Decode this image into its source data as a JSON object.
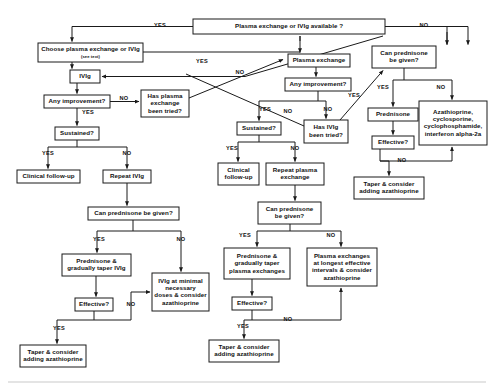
{
  "figure": {
    "type": "flowchart"
  },
  "colors": {
    "box_fill": "#ffffff",
    "box_stroke": "#1a1a1a",
    "text": "#111111",
    "edge": "#1a1a1a"
  },
  "nodes": {
    "n1": {
      "id": "n1",
      "label": "Plasma exchange or IVIg available ?",
      "x": 193,
      "y": 19,
      "w": 192,
      "h": 15
    },
    "n2": {
      "id": "n2",
      "label": "Choose plasma exchange or IVIg",
      "sublabel": "(see text)",
      "x": 38,
      "y": 43,
      "w": 105,
      "h": 19
    },
    "n3": {
      "id": "n3",
      "label": "IVIg",
      "x": 70,
      "y": 70,
      "w": 30,
      "h": 13
    },
    "n4": {
      "id": "n4",
      "label": "Any improvement?",
      "x": 44,
      "y": 95,
      "w": 66,
      "h": 13
    },
    "n5": {
      "id": "n5",
      "label": "Has plasma|exchange|been tried?",
      "x": 141,
      "y": 90,
      "w": 48,
      "h": 27
    },
    "n6": {
      "id": "n6",
      "label": "Sustained?",
      "x": 55,
      "y": 127,
      "w": 44,
      "h": 13
    },
    "n7": {
      "id": "n7",
      "label": "Clinical follow-up",
      "x": 17,
      "y": 170,
      "w": 63,
      "h": 13
    },
    "n8": {
      "id": "n8",
      "label": "Repeat IVIg",
      "x": 103,
      "y": 170,
      "w": 48,
      "h": 13
    },
    "n9": {
      "id": "n9",
      "label": "Can prednisone be given?",
      "x": 88,
      "y": 207,
      "w": 91,
      "h": 13
    },
    "n10": {
      "id": "n10",
      "label": "Prednisone &|gradually taper IVIg",
      "x": 62,
      "y": 254,
      "w": 69,
      "h": 22
    },
    "n11": {
      "id": "n11",
      "label": "Effective?",
      "x": 75,
      "y": 298,
      "w": 38,
      "h": 13
    },
    "n12": {
      "id": "n12",
      "label": "IVIg at minimal|necessary|doses & consider|azathioprine",
      "x": 152,
      "y": 273,
      "w": 57,
      "h": 38
    },
    "n13": {
      "id": "n13",
      "label": "Taper & consider|adding azathioprine",
      "x": 20,
      "y": 345,
      "w": 66,
      "h": 22
    },
    "n14": {
      "id": "n14",
      "label": "Plasma exchange",
      "x": 288,
      "y": 54,
      "w": 62,
      "h": 13
    },
    "n15": {
      "id": "n15",
      "label": "Any improvement?",
      "x": 285,
      "y": 78,
      "w": 66,
      "h": 13
    },
    "n16": {
      "id": "n16",
      "label": "Sustained?",
      "x": 237,
      "y": 122,
      "w": 44,
      "h": 13
    },
    "n17": {
      "id": "n17",
      "label": "Has IVIg|been tried?",
      "x": 304,
      "y": 120,
      "w": 44,
      "h": 23
    },
    "n18": {
      "id": "n18",
      "label": "Clinical|follow-up",
      "x": 218,
      "y": 163,
      "w": 41,
      "h": 22
    },
    "n19": {
      "id": "n19",
      "label": "Repeat plasma|exchange",
      "x": 266,
      "y": 163,
      "w": 58,
      "h": 22
    },
    "n20": {
      "id": "n20",
      "label": "Can prednisone|be given?",
      "x": 258,
      "y": 202,
      "w": 63,
      "h": 22
    },
    "n21": {
      "id": "n21",
      "label": "Prednisone &|gradually taper|plasma exchanges",
      "x": 224,
      "y": 248,
      "w": 66,
      "h": 31
    },
    "n22": {
      "id": "n22",
      "label": "Effective?",
      "x": 232,
      "y": 297,
      "w": 40,
      "h": 13
    },
    "n23": {
      "id": "n23",
      "label": "Plasma exchanges|at longest effective|intervals & consider|azathioprine",
      "x": 307,
      "y": 248,
      "w": 70,
      "h": 38
    },
    "n24": {
      "id": "n24",
      "label": "Taper & consider|adding azathioprine",
      "x": 209,
      "y": 340,
      "w": 70,
      "h": 22
    },
    "n25": {
      "id": "n25",
      "label": "Can prednisone|be given?",
      "x": 372,
      "y": 46,
      "w": 64,
      "h": 22
    },
    "n26": {
      "id": "n26",
      "label": "Prednisone",
      "x": 368,
      "y": 108,
      "w": 50,
      "h": 13
    },
    "n27": {
      "id": "n27",
      "label": "Effective?",
      "x": 372,
      "y": 136,
      "w": 42,
      "h": 13
    },
    "n28": {
      "id": "n28",
      "label": "Azathioprine,|cyclosporine,|cyclophosphamide,|interferon alpha-2a",
      "x": 419,
      "y": 101,
      "w": 68,
      "h": 44
    },
    "n29": {
      "id": "n29",
      "label": "Taper & consider|adding azathioprine",
      "x": 354,
      "y": 177,
      "w": 70,
      "h": 22
    }
  },
  "edge_labels": [
    {
      "id": "el1",
      "text": "YES",
      "x": 160,
      "y": 26
    },
    {
      "id": "el2",
      "text": "NO",
      "x": 424,
      "y": 26
    },
    {
      "id": "el3",
      "text": "YES",
      "x": 202,
      "y": 62
    },
    {
      "id": "el4",
      "text": "NO",
      "x": 240,
      "y": 73
    },
    {
      "id": "el5",
      "text": "NO",
      "x": 124,
      "y": 99
    },
    {
      "id": "el6",
      "text": "YES",
      "x": 88,
      "y": 113
    },
    {
      "id": "el7",
      "text": "YES",
      "x": 48,
      "y": 154
    },
    {
      "id": "el8",
      "text": "NO",
      "x": 127,
      "y": 154
    },
    {
      "id": "el9",
      "text": "YES",
      "x": 99,
      "y": 240
    },
    {
      "id": "el10",
      "text": "NO",
      "x": 181,
      "y": 240
    },
    {
      "id": "el11",
      "text": "NO",
      "x": 131,
      "y": 305
    },
    {
      "id": "el12",
      "text": "YES",
      "x": 59,
      "y": 329
    },
    {
      "id": "el13",
      "text": "YES",
      "x": 265,
      "y": 110
    },
    {
      "id": "el14",
      "text": "NO",
      "x": 288,
      "y": 112
    },
    {
      "id": "el15",
      "text": "NO",
      "x": 328,
      "y": 110
    },
    {
      "id": "el16",
      "text": "YES",
      "x": 232,
      "y": 149
    },
    {
      "id": "el17",
      "text": "NO",
      "x": 295,
      "y": 149
    },
    {
      "id": "el18",
      "text": "YES",
      "x": 245,
      "y": 236
    },
    {
      "id": "el19",
      "text": "NO",
      "x": 331,
      "y": 236
    },
    {
      "id": "el20",
      "text": "NO",
      "x": 288,
      "y": 320
    },
    {
      "id": "el21",
      "text": "YES",
      "x": 243,
      "y": 327
    },
    {
      "id": "el22",
      "text": "YES",
      "x": 354,
      "y": 96
    },
    {
      "id": "el23",
      "text": "YES",
      "x": 383,
      "y": 88
    },
    {
      "id": "el24",
      "text": "NO",
      "x": 441,
      "y": 88
    },
    {
      "id": "el25",
      "text": "NO",
      "x": 402,
      "y": 161
    }
  ]
}
